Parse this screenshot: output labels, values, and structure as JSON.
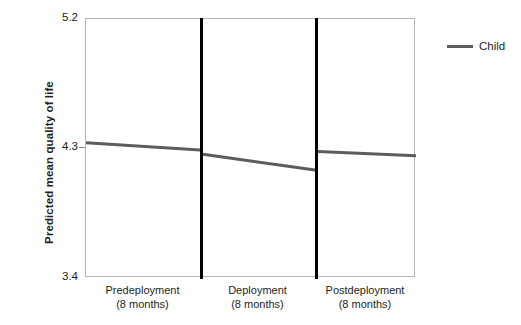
{
  "chart_data": {
    "type": "line",
    "title": "",
    "xlabel": "",
    "ylabel": "Predicted mean quality of life",
    "ylim": [
      3.4,
      5.2
    ],
    "yticks": [
      "3.4",
      "4.3",
      "5.2"
    ],
    "grid": false,
    "legend_position": "right",
    "panels": [
      {
        "name": "Predeployment",
        "sublabel": "(8 months)"
      },
      {
        "name": "Deployment",
        "sublabel": "(8 months)"
      },
      {
        "name": "Postdeployment",
        "sublabel": "(8 months)"
      }
    ],
    "series": [
      {
        "name": "Child",
        "color": "#5c5c5c",
        "segments": [
          {
            "panel": "Predeployment",
            "start_value": 4.34,
            "end_value": 4.29
          },
          {
            "panel": "Deployment",
            "start_value": 4.26,
            "end_value": 4.15
          },
          {
            "panel": "Postdeployment",
            "start_value": 4.28,
            "end_value": 4.25
          }
        ]
      }
    ]
  },
  "axis": {
    "y_title": "Predicted mean quality of life",
    "y_tick_top": "5.2",
    "y_tick_mid": "4.3",
    "y_tick_bottom": "3.4"
  },
  "categories": [
    {
      "name": "Predeployment",
      "sublabel": "(8 months)"
    },
    {
      "name": "Deployment",
      "sublabel": "(8 months)"
    },
    {
      "name": "Postdeployment",
      "sublabel": "(8 months)"
    }
  ],
  "legend": {
    "entries": [
      {
        "label": "Child",
        "color": "#5c5c5c"
      }
    ]
  },
  "colors": {
    "series_line": "#5c5c5c",
    "frame": "#b5b5b5",
    "divider": "#000000",
    "text": "#231f20"
  }
}
